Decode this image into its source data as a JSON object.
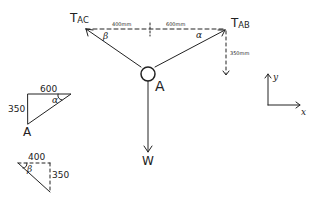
{
  "diagram": {
    "type": "free-body-diagram",
    "ink_color": "#222222",
    "node": {
      "label": "A"
    },
    "forces": [
      {
        "name": "tension-ac",
        "label_main": "T",
        "label_sub": "AC",
        "angle_label": "β"
      },
      {
        "name": "tension-ab",
        "label_main": "T",
        "label_sub": "AB",
        "angle_label": "α"
      },
      {
        "name": "weight",
        "label": "W"
      }
    ],
    "dimensions": {
      "left_horizontal": "400mm",
      "right_horizontal": "600mm",
      "vertical": "350mm"
    },
    "triangle_alpha": {
      "top": "600",
      "side": "350",
      "angle": "α",
      "vertex": "A"
    },
    "triangle_beta": {
      "top": "400",
      "side": "350",
      "angle": "β"
    },
    "axes": {
      "x_label": "x",
      "y_label": "y"
    }
  }
}
